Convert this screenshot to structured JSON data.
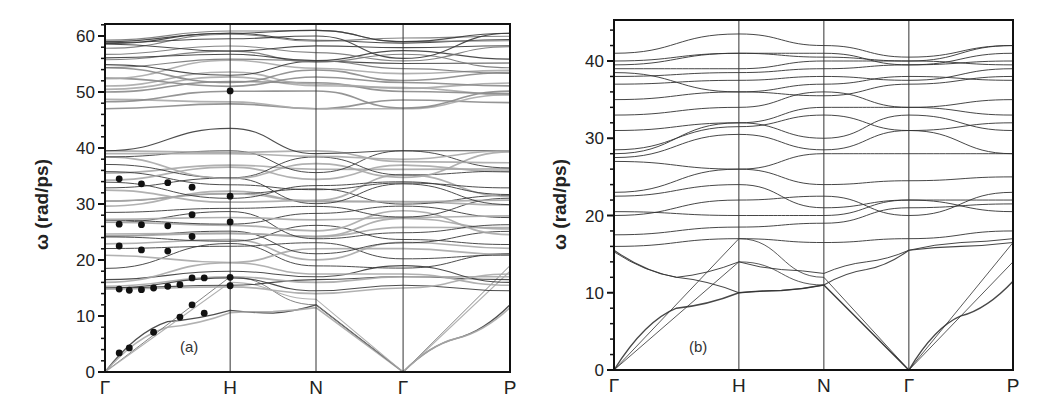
{
  "chart_data": [
    {
      "type": "line",
      "title": "",
      "panel_label": "(a)",
      "xlabel": "",
      "ylabel": "ω (rad/ps)",
      "ylim": [
        0,
        62
      ],
      "yticks": [
        0,
        10,
        20,
        30,
        40,
        50,
        60
      ],
      "x_high_symmetry_points": [
        "Γ",
        "H",
        "N",
        "Γ",
        "P"
      ],
      "x_positions": [
        0,
        0.309,
        0.521,
        0.736,
        1.0
      ],
      "grid": false,
      "vertical_lines_at_symmetry_points": true,
      "line_colors": [
        "#444444",
        "#aaaaaa"
      ],
      "description": "Phonon dispersion curves (dark = one calculation, light grey = another) with experimental data points (filled circles)",
      "experimental_points": [
        {
          "x": 0.035,
          "y": 3.4
        },
        {
          "x": 0.06,
          "y": 4.3
        },
        {
          "x": 0.12,
          "y": 7.1
        },
        {
          "x": 0.185,
          "y": 9.8
        },
        {
          "x": 0.245,
          "y": 10.5
        },
        {
          "x": 0.215,
          "y": 12.0
        },
        {
          "x": 0.035,
          "y": 14.8
        },
        {
          "x": 0.06,
          "y": 14.6
        },
        {
          "x": 0.09,
          "y": 14.7
        },
        {
          "x": 0.12,
          "y": 15.0
        },
        {
          "x": 0.155,
          "y": 15.3
        },
        {
          "x": 0.185,
          "y": 15.6
        },
        {
          "x": 0.215,
          "y": 16.8
        },
        {
          "x": 0.245,
          "y": 16.8
        },
        {
          "x": 0.309,
          "y": 16.9
        },
        {
          "x": 0.309,
          "y": 15.4
        },
        {
          "x": 0.035,
          "y": 22.5
        },
        {
          "x": 0.09,
          "y": 21.8
        },
        {
          "x": 0.155,
          "y": 21.6
        },
        {
          "x": 0.215,
          "y": 24.2
        },
        {
          "x": 0.035,
          "y": 26.4
        },
        {
          "x": 0.09,
          "y": 26.3
        },
        {
          "x": 0.155,
          "y": 26.1
        },
        {
          "x": 0.215,
          "y": 28.1
        },
        {
          "x": 0.309,
          "y": 26.8
        },
        {
          "x": 0.309,
          "y": 31.4
        },
        {
          "x": 0.035,
          "y": 34.5
        },
        {
          "x": 0.09,
          "y": 33.6
        },
        {
          "x": 0.155,
          "y": 33.8
        },
        {
          "x": 0.215,
          "y": 33.0
        },
        {
          "x": 0.309,
          "y": 50.2
        }
      ],
      "band_groups_approx": {
        "acoustic_max_at_H": 11,
        "optical_low_range": [
          14,
          40
        ],
        "gap": [
          40,
          47
        ],
        "optical_high_range": [
          47,
          61
        ]
      }
    },
    {
      "type": "line",
      "title": "",
      "panel_label": "(b)",
      "xlabel": "",
      "ylabel": "ω (rad/ps)",
      "ylim": [
        0,
        45
      ],
      "yticks": [
        0,
        10,
        20,
        30,
        40
      ],
      "x_high_symmetry_points": [
        "Γ",
        "H",
        "N",
        "Γ",
        "P"
      ],
      "x_positions": [
        0,
        0.313,
        0.526,
        0.739,
        1.0
      ],
      "grid": false,
      "vertical_lines_at_symmetry_points": true,
      "line_colors": [
        "#333333"
      ],
      "description": "Phonon dispersion curves, single calculation",
      "band_groups_approx": {
        "acoustic_max_at_H": 10,
        "optical_range": [
          10,
          43
        ]
      }
    }
  ],
  "panels": {
    "a": {
      "label": "(a)",
      "ylabel": "ω (rad/ps)",
      "yticks": [
        "0",
        "10",
        "20",
        "30",
        "40",
        "50",
        "60"
      ],
      "xticks": [
        "Γ",
        "H",
        "N",
        "Γ",
        "P"
      ]
    },
    "b": {
      "label": "(b)",
      "ylabel": "ω (rad/ps)",
      "yticks": [
        "0",
        "10",
        "20",
        "30",
        "40"
      ],
      "xticks": [
        "Γ",
        "H",
        "N",
        "Γ",
        "P"
      ]
    }
  }
}
